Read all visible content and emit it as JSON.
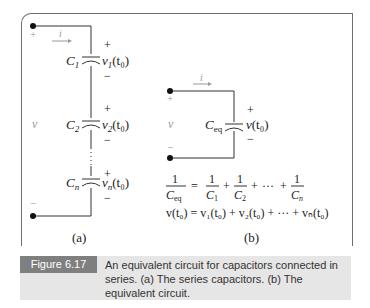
{
  "figure": {
    "label": "Figure 6.17",
    "caption": "An equivalent circuit for capacitors connected in series. (a) The series capacitors. (b) The equivalent circuit."
  },
  "circuit_a": {
    "sublabel": "(a)",
    "terminal_voltage": "v",
    "current": "i",
    "plus": "+",
    "minus": "−",
    "capacitors": [
      {
        "name": "C",
        "sub": "1",
        "voltage": "v",
        "vsub": "1",
        "arg": "(t₀)"
      },
      {
        "name": "C",
        "sub": "2",
        "voltage": "v",
        "vsub": "2",
        "arg": "(t₀)"
      },
      {
        "name": "C",
        "sub": "n",
        "voltage": "v",
        "vsub": "n",
        "arg": "(t₀)"
      }
    ]
  },
  "circuit_b": {
    "sublabel": "(b)",
    "terminal_voltage": "v",
    "current": "i",
    "capacitor": {
      "name": "C",
      "sub": "eq",
      "voltage": "v",
      "arg": "(t₀)"
    },
    "equation1": {
      "lhs_num": "1",
      "lhs_den": "C",
      "lhs_den_sub": "eq",
      "terms": [
        {
          "num": "1",
          "den": "C",
          "sub": "1"
        },
        {
          "num": "1",
          "den": "C",
          "sub": "2"
        },
        {
          "num": "1",
          "den": "C",
          "sub": "n"
        }
      ],
      "ellipsis": "···"
    },
    "equation2": "v(t₀) = v₁(t₀) + v₂(t₀) + ··· + vₙ(t₀)"
  }
}
